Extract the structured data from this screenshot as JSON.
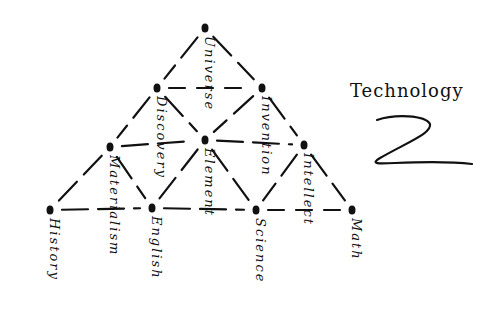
{
  "diagram": {
    "title": "Technology",
    "symbol": "Z",
    "nodes": [
      {
        "id": "universe",
        "label": "Universe",
        "x": 205,
        "y": 28
      },
      {
        "id": "discovery",
        "label": "Discovery",
        "x": 157,
        "y": 88
      },
      {
        "id": "invention",
        "label": "Invention",
        "x": 262,
        "y": 88
      },
      {
        "id": "materialism",
        "label": "Materialism",
        "x": 110,
        "y": 147
      },
      {
        "id": "element",
        "label": "Element",
        "x": 205,
        "y": 140
      },
      {
        "id": "intellect",
        "label": "Intellect",
        "x": 304,
        "y": 145
      },
      {
        "id": "history",
        "label": "History",
        "x": 50,
        "y": 210
      },
      {
        "id": "english",
        "label": "English",
        "x": 152,
        "y": 208
      },
      {
        "id": "science",
        "label": "Science",
        "x": 256,
        "y": 210
      },
      {
        "id": "math",
        "label": "Math",
        "x": 352,
        "y": 210
      }
    ],
    "edges": [
      [
        "universe",
        "discovery"
      ],
      [
        "universe",
        "invention"
      ],
      [
        "discovery",
        "invention"
      ],
      [
        "discovery",
        "materialism"
      ],
      [
        "discovery",
        "element"
      ],
      [
        "invention",
        "element"
      ],
      [
        "invention",
        "intellect"
      ],
      [
        "materialism",
        "element"
      ],
      [
        "element",
        "intellect"
      ],
      [
        "materialism",
        "history"
      ],
      [
        "materialism",
        "english"
      ],
      [
        "element",
        "english"
      ],
      [
        "element",
        "science"
      ],
      [
        "intellect",
        "science"
      ],
      [
        "intellect",
        "math"
      ],
      [
        "history",
        "english"
      ],
      [
        "english",
        "science"
      ],
      [
        "science",
        "math"
      ]
    ]
  }
}
